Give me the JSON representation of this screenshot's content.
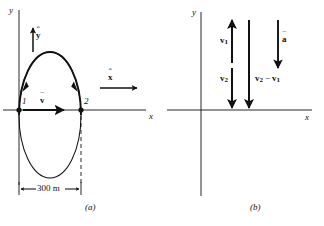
{
  "figure": {
    "background_color": "#ffffff",
    "line_color": "#111111",
    "panels": [
      {
        "id": "a",
        "caption": "(a)",
        "axes": {
          "x_label": "x",
          "y_label": "y"
        },
        "path": {
          "shape": "ellipse",
          "direction": "counterclockwise-drawn-clockwise"
        },
        "points": [
          {
            "name": "point-1",
            "label": "1"
          },
          {
            "name": "point-2",
            "label": "2"
          }
        ],
        "vectors": [
          {
            "name": "velocity",
            "label": "v",
            "decoration": "overbar",
            "direction": "right"
          },
          {
            "name": "unit-vector-y",
            "label": "y",
            "decoration": "hat",
            "direction": "up"
          },
          {
            "name": "unit-vector-x",
            "label": "x",
            "decoration": "hat",
            "direction": "right"
          }
        ],
        "dimension": {
          "label": "300 m",
          "value": 300,
          "unit": "m"
        }
      },
      {
        "id": "b",
        "caption": "(b)",
        "axes": {
          "x_label": "x",
          "y_label": "y"
        },
        "vectors": [
          {
            "name": "v1",
            "label": "v",
            "subscript": "1",
            "decoration": "bold",
            "direction": "up"
          },
          {
            "name": "v2",
            "label": "v",
            "subscript": "2",
            "decoration": "bold",
            "direction": "down"
          },
          {
            "name": "v2-minus-v1",
            "label": "v₂ − v₁",
            "decoration": "bold",
            "direction": "down"
          },
          {
            "name": "acceleration",
            "label": "a",
            "decoration": "overbar",
            "direction": "down"
          }
        ]
      }
    ]
  },
  "labels": {
    "a": {
      "y_axis": "y",
      "x_axis": "x",
      "unit_y": "y",
      "unit_x": "x",
      "velocity": "v",
      "point1": "1",
      "point2": "2",
      "dimension": "300 m",
      "caption": "(a)"
    },
    "b": {
      "y_axis": "y",
      "x_axis": "x",
      "v1_base": "v",
      "v1_sub": "1",
      "v2_base": "v",
      "v2_sub": "2",
      "diff_v2_base": "v",
      "diff_v2_sub": "2",
      "diff_minus": "−",
      "diff_v1_base": "v",
      "diff_v1_sub": "1",
      "accel": "a",
      "caption": "(b)"
    }
  },
  "marks": {
    "hat": "ˆ",
    "bar": "‾"
  }
}
